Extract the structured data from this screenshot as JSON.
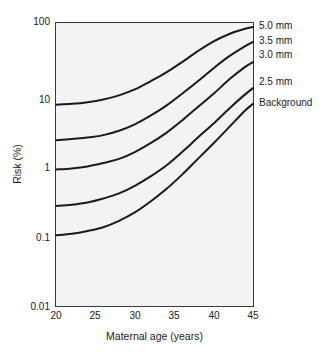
{
  "chart_data": {
    "type": "line",
    "title": "",
    "xlabel": "Maternal age (years)",
    "ylabel": "Risk (%)",
    "yscale": "log",
    "xlim": [
      20,
      45
    ],
    "ylim": [
      0.01,
      100
    ],
    "grid": false,
    "legend_position": "right",
    "xticks": [
      "20",
      "25",
      "30",
      "35",
      "40",
      "45"
    ],
    "yticks": [
      "100",
      "10",
      "1",
      "0.1",
      "0.01"
    ],
    "x": [
      20,
      22,
      24,
      26,
      28,
      30,
      32,
      34,
      36,
      38,
      40,
      42,
      44,
      45
    ],
    "series": [
      {
        "name": "5.0 mm",
        "values": [
          7.0,
          7.2,
          7.6,
          8.3,
          9.5,
          11.5,
          15.0,
          20.0,
          28.0,
          40.0,
          55.0,
          70.0,
          83.0,
          88.0
        ]
      },
      {
        "name": "3.5 mm",
        "values": [
          2.2,
          2.3,
          2.4,
          2.6,
          3.0,
          3.7,
          4.9,
          6.8,
          10.0,
          15.0,
          23.0,
          34.0,
          47.0,
          54.0
        ]
      },
      {
        "name": "3.0 mm",
        "values": [
          0.85,
          0.88,
          0.94,
          1.05,
          1.2,
          1.5,
          2.0,
          2.8,
          4.2,
          6.5,
          10.0,
          16.0,
          24.0,
          28.0
        ]
      },
      {
        "name": "2.5 mm",
        "values": [
          0.26,
          0.27,
          0.29,
          0.33,
          0.39,
          0.5,
          0.68,
          0.97,
          1.5,
          2.4,
          3.8,
          6.2,
          9.8,
          12.0
        ]
      },
      {
        "name": "Background",
        "values": [
          0.1,
          0.105,
          0.115,
          0.13,
          0.16,
          0.21,
          0.3,
          0.45,
          0.72,
          1.2,
          2.0,
          3.4,
          5.8,
          7.2
        ]
      }
    ],
    "annotations": [
      {
        "label": "5.0 mm",
        "top": 21
      },
      {
        "label": "3.5 mm",
        "top": 36
      },
      {
        "label": "3.0 mm",
        "top": 50
      },
      {
        "label": "2.5 mm",
        "top": 77
      },
      {
        "label": "Background",
        "top": 98
      }
    ]
  },
  "axes": {
    "y_tick_tops": [
      17,
      95,
      163,
      233,
      302
    ],
    "x_tick_lefts": [
      43,
      82,
      122,
      161,
      201,
      240
    ],
    "x_tick_top": 311
  },
  "style": {
    "curve_color": "#1a1a1a",
    "plot_background": "#f3f3f3",
    "frame_color": "#3a3a3a",
    "page_background": "#ffffff"
  }
}
